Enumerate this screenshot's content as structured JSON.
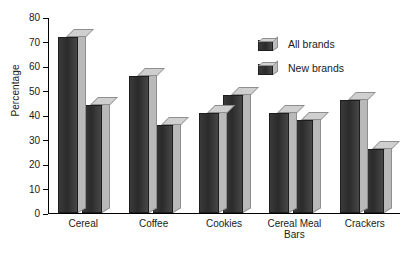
{
  "chart_data": {
    "type": "bar",
    "title": "",
    "xlabel": "",
    "ylabel": "Percentage",
    "ylim": [
      0,
      80
    ],
    "yticks": [
      0,
      10,
      20,
      30,
      40,
      50,
      60,
      70,
      80
    ],
    "grid": false,
    "legend_position": "upper right",
    "categories": [
      "Cereal",
      "Coffee",
      "Cookies",
      "Cereal Meal\nBars",
      "Crackers"
    ],
    "series": [
      {
        "name": "All brands",
        "values": [
          72,
          56,
          41,
          41,
          46
        ]
      },
      {
        "name": "New brands",
        "values": [
          44,
          36,
          48,
          38,
          26
        ]
      }
    ],
    "style": {
      "bar_front_color": "#2b2b2b",
      "bar_side_color": "#b9b9b9",
      "bar_top_color": "#cfcfcf",
      "axis_color": "#000000",
      "background": "#ffffff"
    }
  },
  "legend": {
    "items": [
      {
        "label": "All brands"
      },
      {
        "label": "New brands"
      }
    ]
  },
  "axis": {
    "y_title": "Percentage",
    "y_tick_labels": [
      "0",
      "10",
      "20",
      "30",
      "40",
      "50",
      "60",
      "70",
      "80"
    ],
    "x_tick_labels": [
      "Cereal",
      "Coffee",
      "Cookies",
      "Cereal Meal\nBars",
      "Crackers"
    ]
  }
}
